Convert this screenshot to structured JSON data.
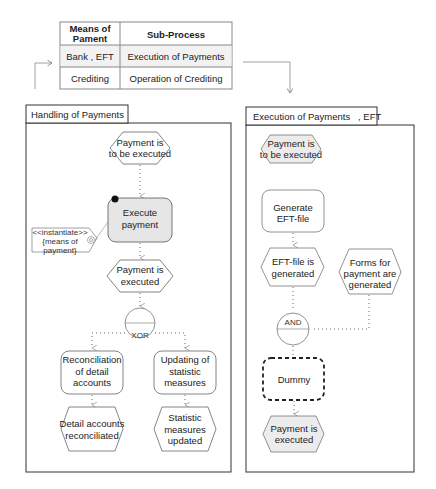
{
  "mapping_table": {
    "headers": [
      "Means of Pament",
      "Sub-Process"
    ],
    "header_lines": [
      [
        "Means of",
        "Pament"
      ],
      [
        "Sub-Process"
      ]
    ],
    "rows": [
      [
        "Bank , EFT",
        "Execution of Payments"
      ],
      [
        "Crediting",
        "Operation of Crediting"
      ]
    ]
  },
  "left_panel": {
    "title": "Handling of Payments",
    "nodes": {
      "event_start": [
        "Payment is",
        "to be executed"
      ],
      "function_execute": [
        "Execute",
        "payment"
      ],
      "annotation": [
        "<<instantiate>>",
        "{means of",
        "payment}"
      ],
      "event_executed": [
        "Payment is",
        "executed"
      ],
      "connector": "XOR",
      "function_reconcile": [
        "Reconciliation",
        "of detail",
        "accounts"
      ],
      "function_update": [
        "Updating of",
        "statistic",
        "measures"
      ],
      "event_reconciled": [
        "Detail accounts",
        "reconciliated"
      ],
      "event_updated": [
        "Statistic",
        "measures",
        "updated"
      ]
    }
  },
  "right_panel": {
    "title": "Execution of Payments   , EFT",
    "nodes": {
      "event_start": [
        "Payment is",
        "to be executed"
      ],
      "function_generate": [
        "Generate",
        "EFT-file"
      ],
      "event_file_generated": [
        "EFT-file is",
        "generated"
      ],
      "event_forms_generated": [
        "Forms for",
        "payment are",
        "generated"
      ],
      "connector": "AND",
      "function_dummy": [
        "Dummy"
      ],
      "event_executed": [
        "Payment is",
        "executed"
      ]
    }
  },
  "colors": {
    "line": "#555555",
    "event_fill_highlight": "#ececec",
    "function_fill_highlight": "#e6e6e6",
    "table_row_highlight": "#f2f2f2"
  }
}
